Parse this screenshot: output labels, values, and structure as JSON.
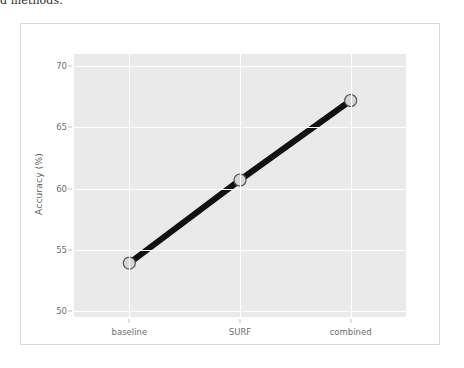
{
  "page": {
    "top_text_fragment": "d methods."
  },
  "chart_data": {
    "type": "line",
    "title": "",
    "subtitle": "",
    "xlabel": "",
    "ylabel": "Accuracy (%)",
    "categories": [
      "baseline",
      "SURF",
      "combined"
    ],
    "values": [
      53.9,
      60.7,
      67.2
    ],
    "series": [
      {
        "name": "accuracy",
        "values": [
          53.9,
          60.7,
          67.2
        ]
      }
    ],
    "ylim": [
      49.5,
      71.0
    ],
    "yticks": [
      50,
      55,
      60,
      65,
      70
    ],
    "ytick_labels": [
      "50",
      "55",
      "60",
      "65",
      "70"
    ],
    "xtick_labels": [
      "baseline",
      "SURF",
      "combined"
    ],
    "grid": true,
    "legend": "none",
    "style": {
      "plot_background": "#eaeaea",
      "gridline_color": "#ffffff",
      "figure_background": "#ffffff",
      "line_color": "#111111",
      "marker_face_color": "#d6d6d6",
      "marker_edge_color": "#555555",
      "tick_label_color": "#6e6e6e",
      "axis_label_color": "#5d5d5d"
    }
  }
}
